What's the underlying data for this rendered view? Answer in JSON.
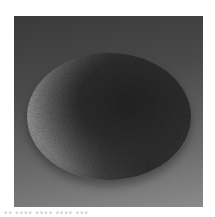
{
  "image": {
    "subject": "granular powder pile",
    "description": "Grayscale photograph of a rounded conical mound of fine granular material on a gray gradient background, lit from the upper-left",
    "palette": {
      "background_top": "#3a3a3a",
      "background_bottom": "#8a8a8a",
      "pile_highlight": "#7a7a7a",
      "pile_shadow": "#1c1c1c",
      "page": "#ffffff"
    }
  },
  "caption": {
    "text": "▪▪ ▪▪▪▪ ▪▪▪▪        ▪▪▪▪ ▪▪▪"
  }
}
